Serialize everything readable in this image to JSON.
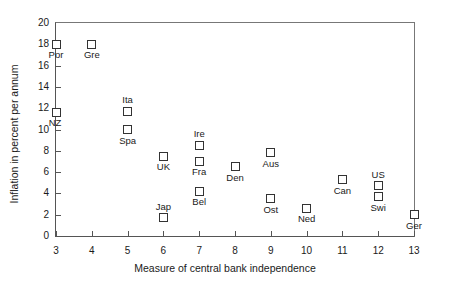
{
  "chart_data": {
    "type": "scatter",
    "title": "",
    "xlabel": "Measure of central bank independence",
    "ylabel": "Inflation in percent per annum",
    "xlim": [
      3,
      13
    ],
    "ylim": [
      0,
      20
    ],
    "xticks": [
      3,
      4,
      5,
      6,
      7,
      8,
      9,
      10,
      11,
      12,
      13
    ],
    "yticks": [
      0,
      2,
      4,
      6,
      8,
      10,
      12,
      14,
      16,
      18,
      20
    ],
    "grid": false,
    "legend": null,
    "marker": "open-square",
    "points": [
      {
        "label": "Por",
        "x": 3,
        "y": 18.0,
        "label_pos": "below"
      },
      {
        "label": "NZ",
        "x": 3,
        "y": 11.6,
        "label_pos": "below-left"
      },
      {
        "label": "Gre",
        "x": 4,
        "y": 18.0,
        "label_pos": "below"
      },
      {
        "label": "Ita",
        "x": 5,
        "y": 11.7,
        "label_pos": "above"
      },
      {
        "label": "Spa",
        "x": 5,
        "y": 10.0,
        "label_pos": "below"
      },
      {
        "label": "UK",
        "x": 6,
        "y": 7.5,
        "label_pos": "below"
      },
      {
        "label": "Jap",
        "x": 6,
        "y": 1.7,
        "label_pos": "above"
      },
      {
        "label": "Ire",
        "x": 7,
        "y": 8.5,
        "label_pos": "above"
      },
      {
        "label": "Fra",
        "x": 7,
        "y": 7.0,
        "label_pos": "below"
      },
      {
        "label": "Bel",
        "x": 7,
        "y": 4.2,
        "label_pos": "below"
      },
      {
        "label": "Den",
        "x": 8,
        "y": 6.5,
        "label_pos": "below"
      },
      {
        "label": "Aus",
        "x": 9,
        "y": 7.8,
        "label_pos": "below"
      },
      {
        "label": "Ost",
        "x": 9,
        "y": 3.5,
        "label_pos": "below"
      },
      {
        "label": "Ned",
        "x": 10,
        "y": 2.6,
        "label_pos": "below"
      },
      {
        "label": "Can",
        "x": 11,
        "y": 5.3,
        "label_pos": "below"
      },
      {
        "label": "US",
        "x": 12,
        "y": 4.7,
        "label_pos": "above"
      },
      {
        "label": "Swi",
        "x": 12,
        "y": 3.7,
        "label_pos": "below"
      },
      {
        "label": "Ger",
        "x": 13,
        "y": 2.0,
        "label_pos": "below"
      }
    ]
  }
}
